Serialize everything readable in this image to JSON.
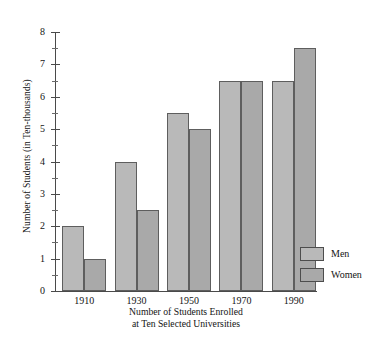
{
  "chart_data": {
    "type": "bar",
    "title": "",
    "subtitle": "",
    "categories": [
      "1910",
      "1930",
      "1950",
      "1970",
      "1990"
    ],
    "series": [
      {
        "name": "Men",
        "color": "#b9b9b9",
        "values": [
          2.0,
          4.0,
          5.5,
          6.5,
          6.5
        ]
      },
      {
        "name": "Women",
        "color": "#a9a9a9",
        "values": [
          1.0,
          2.5,
          5.0,
          6.5,
          7.5
        ]
      }
    ],
    "xlabel": "Number of Students Enrolled\nat Ten Selected Universities",
    "xlabel_line1": "Number of Students Enrolled",
    "xlabel_line2": "at Ten Selected Universities",
    "ylabel": "Number of Students (in Ten-thousands)",
    "ylim": [
      0,
      8
    ],
    "ytick_labels": [
      "0",
      "1",
      "2",
      "3",
      "4",
      "5",
      "6",
      "7",
      "8"
    ],
    "ytick_values": [
      0,
      1,
      2,
      3,
      4,
      5,
      6,
      7,
      8
    ],
    "yminor_values": [
      0.5,
      1.5,
      2.5,
      3.5,
      4.5,
      5.5,
      6.5,
      7.5
    ],
    "grid": false,
    "legend_position": "right"
  },
  "legend": {
    "items": [
      {
        "label": "Men",
        "swatch": "men-swatch"
      },
      {
        "label": "Women",
        "swatch": "women-swatch"
      }
    ]
  }
}
